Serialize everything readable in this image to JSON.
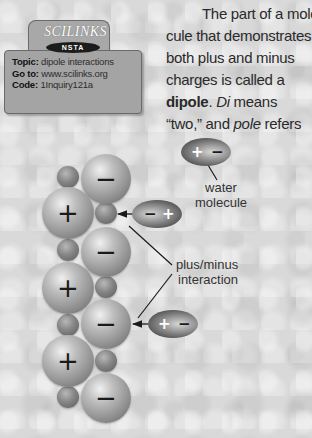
{
  "scilinks_badge": {
    "logo": "SCILINKS",
    "org": "NSTA",
    "topic_label": "Topic:",
    "topic_value": "dipole interactions",
    "goto_label": "Go to:",
    "goto_value": "www.scilinks.org",
    "code_label": "Code:",
    "code_value": "1Inquiry121a"
  },
  "paragraph": {
    "line1": "The part of a mole-",
    "line2": "cule that demonstrates",
    "line3": "both plus and minus",
    "line4": "charges is called a",
    "line5_bold": "dipole",
    "line5_rest": ". ",
    "line5_italic": "Di",
    "line5_end": " means",
    "line6_start": "“two,” and ",
    "line6_italic": "pole",
    "line6_end": " refers"
  },
  "diagram": {
    "labels": {
      "water_molecule_line1": "water",
      "water_molecule_line2": "molecule",
      "interaction_line1": "plus/minus",
      "interaction_line2": "interaction"
    },
    "plus_sign": "+",
    "minus_sign": "−",
    "large_positive_spheres": 3,
    "large_negative_spheres": 4,
    "water_molecules": [
      {
        "position": "top-right",
        "left_sign": "+",
        "right_sign": "−"
      },
      {
        "position": "middle",
        "left_sign": "−",
        "right_sign": "+"
      },
      {
        "position": "bottom",
        "left_sign": "+",
        "right_sign": "−"
      }
    ],
    "colors": {
      "background": "#d9d9d9",
      "sphere": "#9a9a9a",
      "water": "#4e4e4e",
      "text": "#2a2a2a"
    }
  }
}
